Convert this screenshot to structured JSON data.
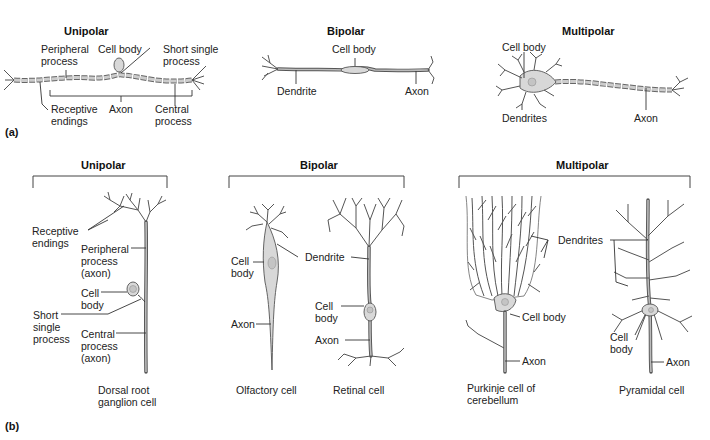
{
  "figure": {
    "part_a": {
      "label": "(a)",
      "unipolar": {
        "title": "Unipolar",
        "labels": {
          "peripheral_process": "Peripheral\nprocess",
          "cell_body": "Cell body",
          "short_single_process": "Short single\nprocess",
          "receptive_endings": "Receptive\nendings",
          "axon": "Axon",
          "central_process": "Central\nprocess"
        }
      },
      "bipolar": {
        "title": "Bipolar",
        "labels": {
          "cell_body": "Cell body",
          "dendrite": "Dendrite",
          "axon": "Axon"
        }
      },
      "multipolar": {
        "title": "Multipolar",
        "labels": {
          "cell_body": "Cell body",
          "dendrites": "Dendrites",
          "axon": "Axon"
        }
      }
    },
    "part_b": {
      "label": "(b)",
      "unipolar": {
        "title": "Unipolar",
        "labels": {
          "receptive_endings": "Receptive\nendings",
          "peripheral_process": "Peripheral\nprocess\n(axon)",
          "cell_body": "Cell\nbody",
          "short_single_process": "Short\nsingle\nprocess",
          "central_process": "Central\nprocess\n(axon)"
        },
        "caption": "Dorsal root\nganglion cell"
      },
      "bipolar": {
        "title": "Bipolar",
        "olfactory": {
          "labels": {
            "cell_body": "Cell\nbody",
            "axon": "Axon"
          },
          "caption": "Olfactory cell"
        },
        "shared_labels": {
          "dendrite": "Dendrite"
        },
        "retinal": {
          "labels": {
            "cell_body": "Cell\nbody",
            "axon": "Axon"
          },
          "caption": "Retinal cell"
        }
      },
      "multipolar": {
        "title": "Multipolar",
        "shared_labels": {
          "dendrites": "Dendrites"
        },
        "purkinje": {
          "labels": {
            "cell_body": "Cell body",
            "axon": "Axon"
          },
          "caption": "Purkinje cell of\ncerebellum"
        },
        "pyramidal": {
          "labels": {
            "cell_body": "Cell\nbody",
            "axon": "Axon"
          },
          "caption": "Pyramidal cell"
        }
      }
    }
  }
}
